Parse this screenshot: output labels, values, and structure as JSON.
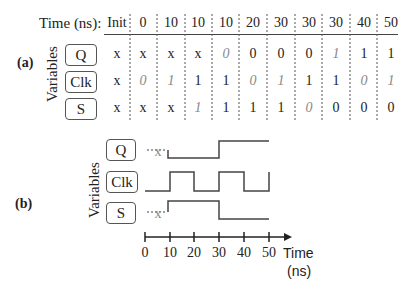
{
  "panel_a": {
    "label": "(a)",
    "time_label": "Time (ns):",
    "axis_title": "Variables",
    "columns": [
      "Init",
      "0",
      "10",
      "10",
      "10",
      "20",
      "30",
      "30",
      "30",
      "40",
      "50"
    ],
    "rows": [
      {
        "name": "Q",
        "values": [
          "x",
          "x",
          "x",
          "x",
          "0",
          "0",
          "0",
          "0",
          "1",
          "1",
          "1"
        ],
        "italic": [
          false,
          false,
          false,
          false,
          true,
          false,
          false,
          false,
          true,
          false,
          false
        ]
      },
      {
        "name": "Clk",
        "values": [
          "x",
          "0",
          "1",
          "1",
          "1",
          "0",
          "1",
          "1",
          "1",
          "0",
          "1"
        ],
        "italic": [
          false,
          true,
          true,
          false,
          false,
          true,
          true,
          false,
          false,
          true,
          true
        ]
      },
      {
        "name": "S",
        "values": [
          "x",
          "x",
          "x",
          "1",
          "1",
          "1",
          "1",
          "0",
          "0",
          "0",
          "0"
        ],
        "italic": [
          false,
          false,
          false,
          true,
          false,
          false,
          false,
          true,
          false,
          false,
          false
        ]
      }
    ]
  },
  "panel_b": {
    "label": "(b)",
    "axis_title": "Variables",
    "signals": [
      {
        "name": "Q",
        "unknown_label": "x",
        "transitions": "x until 10, low 10-30, high 30-50"
      },
      {
        "name": "Clk",
        "unknown_label": "",
        "transitions": "low 0-10, high 10-20, low 20-30, high 30-40, low 40-50, rise at 50"
      },
      {
        "name": "S",
        "unknown_label": "x",
        "transitions": "x until 10, high 10-30, low 30-50"
      }
    ],
    "time_axis": {
      "ticks": [
        "0",
        "10",
        "20",
        "30",
        "40",
        "50"
      ],
      "label_line1": "Time",
      "label_line2": "(ns)"
    }
  }
}
